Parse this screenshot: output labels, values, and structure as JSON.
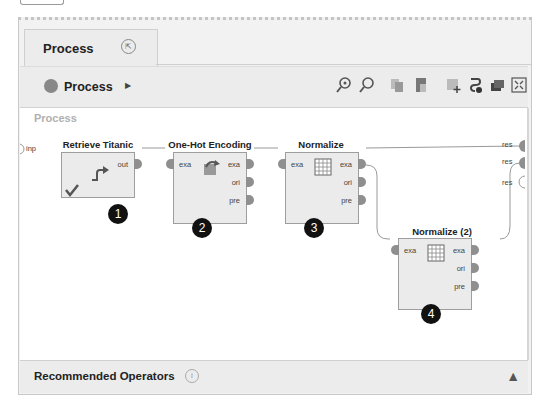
{
  "tab": {
    "label": "Process",
    "pin_icon": "restore-icon"
  },
  "breadcrumb": {
    "label": "Process",
    "arrow_icon": "triangle-right-icon"
  },
  "toolbar": {
    "icons": [
      "zoom-in-icon",
      "zoom-out-icon",
      "copy-icon",
      "paste-icon",
      "add-note-icon",
      "auto-wire-icon",
      "layers-icon",
      "fit-view-icon"
    ]
  },
  "canvas": {
    "title": "Process",
    "input_port": "inp",
    "output_ports": [
      "res",
      "res",
      "res"
    ],
    "operators": [
      {
        "name": "Retrieve Titanic",
        "in": [],
        "out": [
          "out"
        ],
        "badge": "1",
        "icon": "retrieve-arrow-icon",
        "status": "check-icon"
      },
      {
        "name": "One-Hot Encoding",
        "in": [
          "exa"
        ],
        "out": [
          "exa",
          "ori",
          "pre"
        ],
        "badge": "2",
        "icon": "encode-icon"
      },
      {
        "name": "Normalize",
        "in": [
          "exa"
        ],
        "out": [
          "exa",
          "ori",
          "pre"
        ],
        "badge": "3",
        "icon": "table-grid-icon"
      },
      {
        "name": "Normalize (2)",
        "in": [
          "exa"
        ],
        "out": [
          "exa",
          "ori",
          "pre"
        ],
        "badge": "4",
        "icon": "table-grid-icon"
      }
    ]
  },
  "bottom_panel": {
    "label": "Recommended Operators",
    "info_icon": "info-icon",
    "collapse_icon": "chevron-up-icon"
  }
}
